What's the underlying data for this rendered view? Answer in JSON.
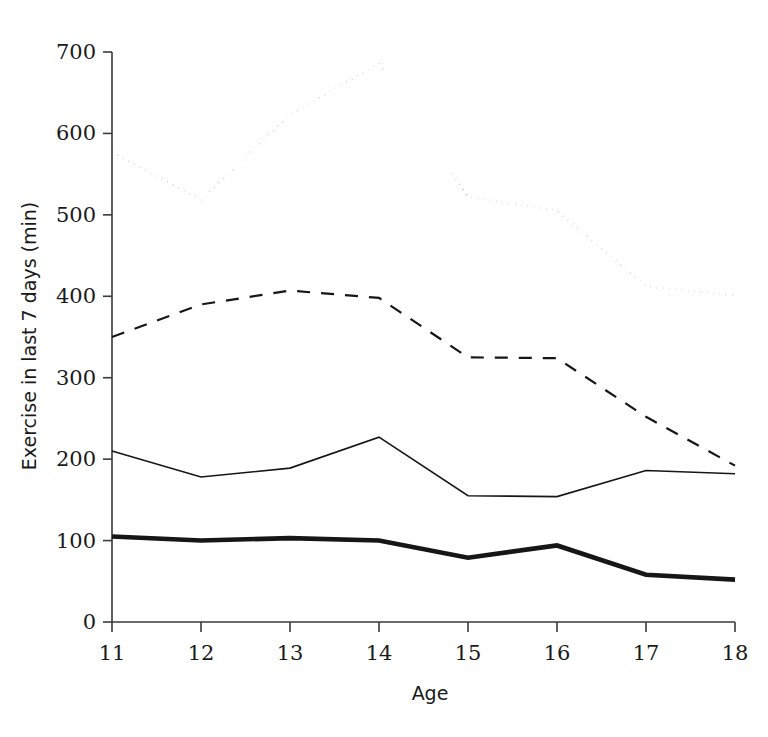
{
  "chart_data": {
    "type": "line",
    "title": "",
    "xlabel": "Age",
    "ylabel": "Exercise in last 7 days (min)",
    "x": [
      11,
      12,
      13,
      14,
      15,
      16,
      17,
      18
    ],
    "categories": [
      "11",
      "12",
      "13",
      "14",
      "15",
      "16",
      "17",
      "18"
    ],
    "xlim": [
      11,
      18
    ],
    "ylim": [
      0,
      700
    ],
    "yticks": [
      0,
      100,
      200,
      300,
      400,
      500,
      600,
      700
    ],
    "ytick_labels": [
      "0",
      "100",
      "200",
      "300",
      "400",
      "500",
      "600",
      "700"
    ],
    "xticks": [
      11,
      12,
      13,
      14,
      15,
      16,
      17,
      18
    ],
    "xtick_labels": [
      "11",
      "12",
      "13",
      "14",
      "15",
      "16",
      "17",
      "18"
    ],
    "grid": false,
    "legend": "none",
    "series": [
      {
        "name": "dotted-series",
        "style": "dotted",
        "linewidth": 2.2,
        "color": "#161616",
        "values": [
          577,
          518,
          623,
          686,
          522,
          505,
          412,
          401
        ]
      },
      {
        "name": "dashed-series",
        "style": "dashed",
        "linewidth": 2.2,
        "color": "#161616",
        "values": [
          350,
          390,
          407,
          398,
          325,
          324,
          252,
          192
        ]
      },
      {
        "name": "thin-solid-series",
        "style": "solid",
        "linewidth": 1.6,
        "color": "#161616",
        "values": [
          210,
          178,
          189,
          227,
          155,
          154,
          186,
          182
        ]
      },
      {
        "name": "thick-solid-series",
        "style": "solid",
        "linewidth": 4.6,
        "color": "#161616",
        "values": [
          105,
          100,
          103,
          100,
          79,
          94,
          58,
          52
        ]
      }
    ]
  },
  "axis": {
    "y_title": "Exercise in last 7 days (min)",
    "x_title": "Age"
  }
}
